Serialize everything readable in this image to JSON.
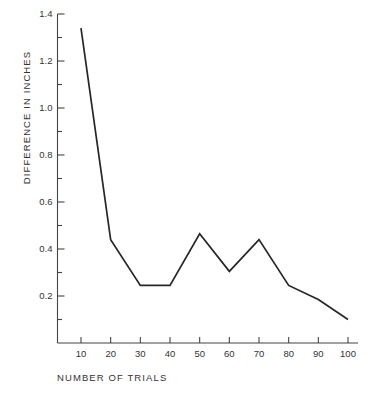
{
  "figure": {
    "clipped_top_text": "",
    "background_color": "#ffffff",
    "line_color": "#262626",
    "axis_color": "#444444"
  },
  "chart_data": {
    "type": "line",
    "title": "",
    "xlabel": "NUMBER  OF  TRIALS",
    "ylabel": "DIFFERENCE  IN  INCHES",
    "x": [
      10,
      20,
      30,
      40,
      50,
      60,
      70,
      80,
      90,
      100
    ],
    "values": [
      1.34,
      0.44,
      0.245,
      0.245,
      0.465,
      0.305,
      0.44,
      0.245,
      0.185,
      0.1
    ],
    "series": [
      {
        "name": "difference",
        "values": [
          1.34,
          0.44,
          0.245,
          0.245,
          0.465,
          0.305,
          0.44,
          0.245,
          0.185,
          0.1
        ]
      }
    ],
    "xlim": [
      0,
      105
    ],
    "ylim": [
      0,
      1.45
    ],
    "xticks": [
      10,
      20,
      30,
      40,
      50,
      60,
      70,
      80,
      90,
      100
    ],
    "xtick_labels": [
      "10",
      "20",
      "30",
      "40",
      "50",
      "60",
      "70",
      "80",
      "90",
      "100"
    ],
    "yticks": [
      0.2,
      0.4,
      0.6,
      0.8,
      1.0,
      1.2,
      1.4
    ],
    "ytick_labels": [
      "0.2",
      "0.4",
      "0.6",
      "0.8",
      "1.0",
      "1.2",
      "1.4"
    ],
    "yminor_ticks": [
      0.1,
      0.3,
      0.5,
      0.7,
      0.9,
      1.1,
      1.3
    ],
    "grid": false,
    "legend": false,
    "legend_position": "none",
    "markers": false
  }
}
